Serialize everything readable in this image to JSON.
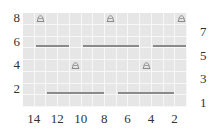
{
  "chart_data": {
    "type": "table",
    "columns": 14,
    "rows": 8,
    "cell_color": "#e6e6e6",
    "gridline_color": "#f7f7f7",
    "left_row_labels": [
      "8",
      "6",
      "4",
      "2"
    ],
    "right_row_labels": [
      "7",
      "5",
      "3",
      "1"
    ],
    "column_labels": [
      "14",
      "12",
      "10",
      "8",
      "6",
      "4",
      "2"
    ],
    "symbols": [
      {
        "type": "bobble",
        "row": 8,
        "col": 13
      },
      {
        "type": "bobble",
        "row": 8,
        "col": 7
      },
      {
        "type": "bobble",
        "row": 8,
        "col": 1
      },
      {
        "type": "bobble",
        "row": 4,
        "col": 10
      },
      {
        "type": "bobble",
        "row": 4,
        "col": 4
      }
    ],
    "purl_runs": [
      {
        "row": 6,
        "from_col": 13,
        "to_col": 11
      },
      {
        "row": 6,
        "from_col": 9,
        "to_col": 5
      },
      {
        "row": 6,
        "from_col": 3,
        "to_col": 1
      },
      {
        "row": 2,
        "from_col": 12,
        "to_col": 8
      },
      {
        "row": 2,
        "from_col": 6,
        "to_col": 2
      }
    ]
  },
  "labels": {
    "left": [
      {
        "text": "8",
        "row": 8
      },
      {
        "text": "6",
        "row": 6
      },
      {
        "text": "4",
        "row": 4
      },
      {
        "text": "2",
        "row": 2
      }
    ],
    "right": [
      {
        "text": "7",
        "row": 7
      },
      {
        "text": "5",
        "row": 5
      },
      {
        "text": "3",
        "row": 3
      },
      {
        "text": "1",
        "row": 1
      }
    ],
    "bottom": [
      {
        "text": "14",
        "col": 14
      },
      {
        "text": "12",
        "col": 12
      },
      {
        "text": "10",
        "col": 10
      },
      {
        "text": "8",
        "col": 8
      },
      {
        "text": "6",
        "col": 6
      },
      {
        "text": "4",
        "col": 4
      },
      {
        "text": "2",
        "col": 2
      }
    ]
  },
  "icons": {
    "bobble": "bobble-icon",
    "purl": "purl-line"
  },
  "colors": {
    "symbol": "#8a8a8a",
    "text": "#333333"
  }
}
